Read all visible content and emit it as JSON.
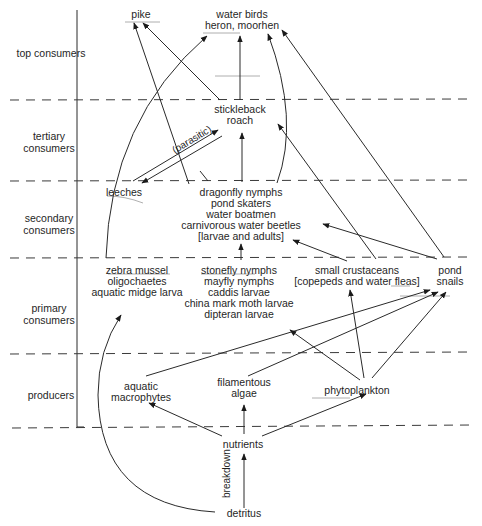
{
  "diagram": {
    "levels": [
      {
        "id": "top",
        "label": "top consumers"
      },
      {
        "id": "tertiary",
        "label": "tertiary consumers"
      },
      {
        "id": "secondary",
        "label": "secondary consumers"
      },
      {
        "id": "primary",
        "label": "primary consumers"
      },
      {
        "id": "producers",
        "label": "producers"
      }
    ],
    "nodes": {
      "pike": {
        "lines": [
          "pike"
        ]
      },
      "water_birds": {
        "lines": [
          "water birds",
          "heron, moorhen"
        ]
      },
      "stickleback": {
        "lines": [
          "stickleback",
          "roach"
        ]
      },
      "leeches": {
        "lines": [
          "leeches"
        ]
      },
      "dragonfly": {
        "lines": [
          "dragonfly nymphs",
          "pond skaters",
          "water boatmen",
          "carnivorous water beetles",
          "[larvae and adults]"
        ]
      },
      "zebra": {
        "lines": [
          "zebra mussel",
          "oligochaetes",
          "aquatic midge larva"
        ]
      },
      "stonefly": {
        "lines": [
          "stonefly nymphs",
          "mayfly nymphs",
          "caddis larvae",
          "china mark moth larvae",
          "dipteran larvae"
        ]
      },
      "crustaceans": {
        "lines": [
          "small crustaceans",
          "[copepeds and water fleas]"
        ]
      },
      "snails": {
        "lines": [
          "pond",
          "snails"
        ]
      },
      "macrophytes": {
        "lines": [
          "aquatic",
          "macrophytes"
        ]
      },
      "algae": {
        "lines": [
          "filamentous",
          "algae"
        ]
      },
      "phytoplankton": {
        "lines": [
          "phytoplankton"
        ]
      },
      "nutrients": {
        "lines": [
          "nutrients"
        ]
      },
      "detritus": {
        "lines": [
          "detritus"
        ]
      }
    },
    "annotations": {
      "parasitic": "(parasitic)",
      "breakdown": "breakdown"
    },
    "edges": [
      {
        "from": "stickleback",
        "to": "pike"
      },
      {
        "from": "leeches",
        "to": "pike"
      },
      {
        "from": "stickleback",
        "to": "water_birds"
      },
      {
        "from": "zebra",
        "to": "water_birds"
      },
      {
        "from": "dragonfly",
        "to": "water_birds"
      },
      {
        "from": "snails",
        "to": "water_birds"
      },
      {
        "from": "leeches",
        "to": "stickleback",
        "label": "parasitic"
      },
      {
        "from": "stickleback",
        "to": "leeches",
        "label": "parasitic"
      },
      {
        "from": "dragonfly",
        "to": "stickleback"
      },
      {
        "from": "crustaceans",
        "to": "stickleback"
      },
      {
        "from": "dragonfly",
        "to": "leeches"
      },
      {
        "from": "stonefly",
        "to": "dragonfly"
      },
      {
        "from": "crustaceans",
        "to": "dragonfly"
      },
      {
        "from": "snails",
        "to": "dragonfly"
      },
      {
        "from": "macrophytes",
        "to": "snails"
      },
      {
        "from": "algae",
        "to": "snails"
      },
      {
        "from": "phytoplankton",
        "to": "snails"
      },
      {
        "from": "phytoplankton",
        "to": "crustaceans"
      },
      {
        "from": "phytoplankton",
        "to": "stonefly"
      },
      {
        "from": "detritus",
        "to": "zebra"
      },
      {
        "from": "nutrients",
        "to": "macrophytes"
      },
      {
        "from": "nutrients",
        "to": "algae"
      },
      {
        "from": "nutrients",
        "to": "phytoplankton"
      },
      {
        "from": "detritus",
        "to": "nutrients",
        "label": "breakdown"
      }
    ],
    "colors": {
      "line": "#2a2a2a",
      "dash": "#3a3a3a",
      "text": "#1f1f1f",
      "background": "#ffffff"
    }
  }
}
